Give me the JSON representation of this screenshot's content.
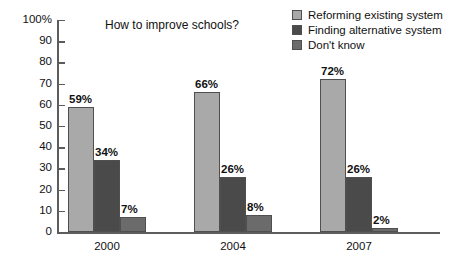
{
  "chart_data": {
    "type": "bar",
    "title": "How to improve schools?",
    "xlabel": "",
    "ylabel": "",
    "categories": [
      "2000",
      "2004",
      "2007"
    ],
    "series": [
      {
        "name": "Reforming existing system",
        "color": "#a9a9a9",
        "values": [
          59,
          66,
          72
        ],
        "labels": [
          "59%",
          "66%",
          "72%"
        ]
      },
      {
        "name": "Finding alternative system",
        "color": "#4a4a4a",
        "values": [
          34,
          26,
          26
        ],
        "labels": [
          "34%",
          "26%",
          "26%"
        ]
      },
      {
        "name": "Don't know",
        "color": "#6b6b6b",
        "values": [
          7,
          8,
          2
        ],
        "labels": [
          "7%",
          "8%",
          "2%"
        ]
      }
    ],
    "ylim": [
      0,
      100
    ],
    "yticks": [
      0,
      10,
      20,
      30,
      40,
      50,
      60,
      70,
      80,
      90,
      100
    ],
    "ytick_labels": [
      "0",
      "10",
      "20",
      "30",
      "40",
      "50",
      "60",
      "70",
      "80",
      "90",
      "100%"
    ],
    "grid": false,
    "legend_position": "top-right",
    "axis_color": "#5c5c5c",
    "background": "#ffffff"
  }
}
